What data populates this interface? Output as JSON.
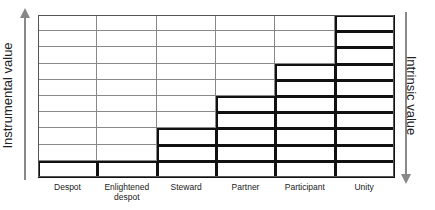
{
  "axes": {
    "left_label": "Instrumental value",
    "right_label": "Intrinsic value",
    "left_direction": "up",
    "right_direction": "down"
  },
  "grid": {
    "rows": 10,
    "columns": [
      {
        "label": "Despot",
        "filled": 1
      },
      {
        "label": "Enlightened despot",
        "filled": 1
      },
      {
        "label": "Steward",
        "filled": 3
      },
      {
        "label": "Partner",
        "filled": 5
      },
      {
        "label": "Participant",
        "filled": 7
      },
      {
        "label": "Unity",
        "filled": 10
      }
    ]
  },
  "colors": {
    "grid_line": "#888888",
    "filled_border": "#111111",
    "arrow": "#888888"
  }
}
